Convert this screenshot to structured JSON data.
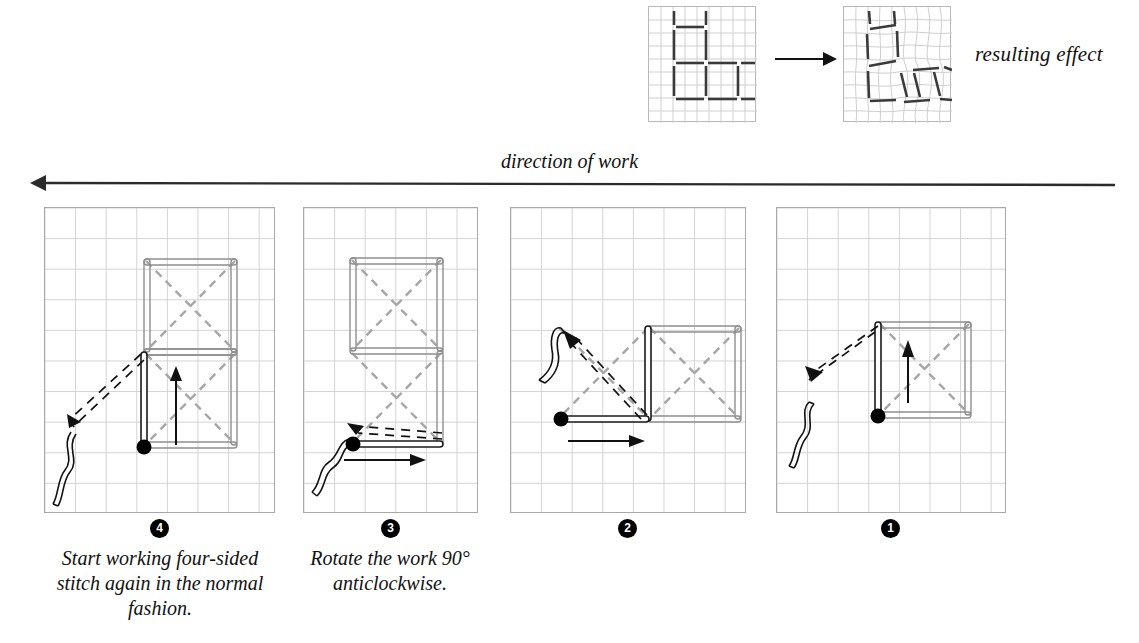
{
  "top_row": {
    "before_label": "worked-sample-grid",
    "after_label": "distorted-sample-grid",
    "transition_icon": "right-arrow-icon",
    "result_label": "resulting effect"
  },
  "direction": {
    "label": "direction of work",
    "arrow_icon": "left-arrow-icon",
    "arrow_direction": "left"
  },
  "panels": [
    {
      "id": 4,
      "number": "④",
      "number_plain": "4",
      "caption": "Start working four-sided stitch again in the normal fashion.",
      "needle_icon": "needle-thread-icon",
      "entry_dot_icon": "stitch-entry-dot-icon",
      "movement_arrow_icon": "up-arrow-icon",
      "completed_squares": 2,
      "orientation": "vertical"
    },
    {
      "id": 3,
      "number": "③",
      "number_plain": "3",
      "caption": "Rotate the work 90° anticlockwise.",
      "needle_icon": "needle-thread-icon",
      "entry_dot_icon": "stitch-entry-dot-icon",
      "movement_arrow_icon": "right-arrow-icon",
      "completed_squares": 2,
      "orientation": "vertical"
    },
    {
      "id": 2,
      "number": "②",
      "number_plain": "2",
      "caption": "",
      "needle_icon": "needle-thread-icon",
      "entry_dot_icon": "stitch-entry-dot-icon",
      "movement_arrow_icon": "right-arrow-icon",
      "completed_squares": 1,
      "orientation": "horizontal"
    },
    {
      "id": 1,
      "number": "①",
      "number_plain": "1",
      "caption": "",
      "needle_icon": "needle-thread-icon",
      "entry_dot_icon": "stitch-entry-dot-icon",
      "movement_arrow_icon": "up-arrow-icon",
      "completed_squares": 1,
      "orientation": "horizontal"
    }
  ],
  "colors": {
    "ink": "#111111",
    "grid_line": "#d3d3d3",
    "panel_border": "#a8a8a8",
    "stitch_outline": "#8f8f8f",
    "back_thread": "#9a9a9a",
    "solid_thread": "#222222",
    "marker_fill": "#000000",
    "marker_text": "#ffffff",
    "page_background": "#ffffff"
  }
}
